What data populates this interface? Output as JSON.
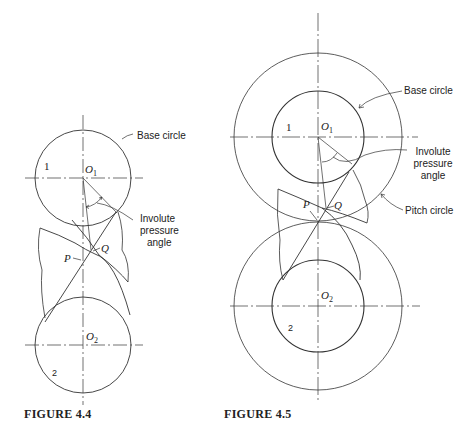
{
  "figures": [
    {
      "caption": "FIGURE 4.4",
      "labels": {
        "base_circle": "Base circle",
        "involute_pressure_angle": [
          "Involute",
          "pressure",
          "angle"
        ],
        "gear1": "1",
        "gear2": "2",
        "O1": "O",
        "O1_sub": "1",
        "O2": "O",
        "O2_sub": "2",
        "P": "P",
        "Q": "Q"
      }
    },
    {
      "caption": "FIGURE 4.5",
      "labels": {
        "base_circle": "Base circle",
        "involute_pressure_angle": [
          "Involute",
          "pressure",
          "angle"
        ],
        "pitch_circle": "Pitch circle",
        "gear1": "1",
        "gear2": "2",
        "O1": "O",
        "O1_sub": "1",
        "O2": "O",
        "O2_sub": "2",
        "P": "P",
        "Q": "Q"
      }
    }
  ]
}
